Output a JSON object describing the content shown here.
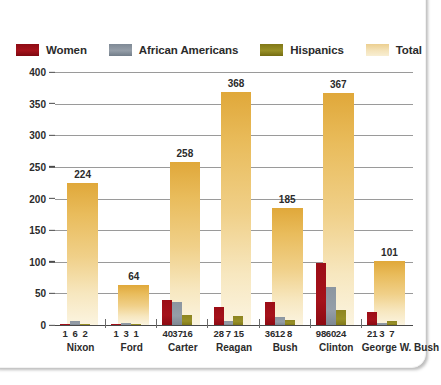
{
  "chart_data": {
    "type": "bar",
    "title": "",
    "xlabel": "",
    "ylabel": "",
    "ylim": [
      0,
      400
    ],
    "yticks": [
      0,
      50,
      100,
      150,
      200,
      250,
      300,
      350,
      400
    ],
    "grid": true,
    "legend_position": "top-left",
    "categories": [
      "Nixon",
      "Ford",
      "Carter",
      "Reagan",
      "Bush",
      "Clinton",
      "George W. Bush"
    ],
    "series": [
      {
        "name": "Women",
        "color": "#9c0d16",
        "values": [
          1,
          1,
          40,
          28,
          36,
          98,
          21
        ]
      },
      {
        "name": "African Americans",
        "color": "#8b95a0",
        "values": [
          6,
          3,
          37,
          7,
          12,
          60,
          3
        ]
      },
      {
        "name": "Hispanics",
        "color": "#8d8420",
        "values": [
          2,
          1,
          16,
          15,
          8,
          24,
          7
        ]
      },
      {
        "name": "Total",
        "color": "#e9bc5c",
        "values": [
          224,
          64,
          258,
          368,
          185,
          367,
          101
        ]
      }
    ],
    "total_labels": [
      "224",
      "64",
      "258",
      "368",
      "185",
      "367",
      "101"
    ]
  },
  "legend": {
    "items": [
      {
        "label": "Women",
        "color": "#9c0d16"
      },
      {
        "label": "African Americans",
        "color": "#8b95a0"
      },
      {
        "label": "Hispanics",
        "color": "#8d8420"
      },
      {
        "label": "Total",
        "color": "#f2dba5"
      }
    ]
  },
  "axis": {
    "yticks": [
      "400",
      "350",
      "300",
      "250",
      "200",
      "150",
      "100",
      "50",
      "0"
    ]
  },
  "groups": [
    {
      "name": "Nixon",
      "values": [
        "1",
        "6",
        "2"
      ],
      "total": "224"
    },
    {
      "name": "Ford",
      "values": [
        "1",
        "3",
        "1"
      ],
      "total": "64"
    },
    {
      "name": "Carter",
      "values": [
        "40",
        "37",
        "16"
      ],
      "total": "258"
    },
    {
      "name": "Reagan",
      "values": [
        "28",
        "7",
        "15"
      ],
      "total": "368"
    },
    {
      "name": "Bush",
      "values": [
        "36",
        "12",
        "8"
      ],
      "total": "185"
    },
    {
      "name": "Clinton",
      "values": [
        "98",
        "60",
        "24"
      ],
      "total": "367"
    },
    {
      "name": "George W. Bush",
      "values": [
        "21",
        "3",
        "7"
      ],
      "total": "101"
    }
  ]
}
